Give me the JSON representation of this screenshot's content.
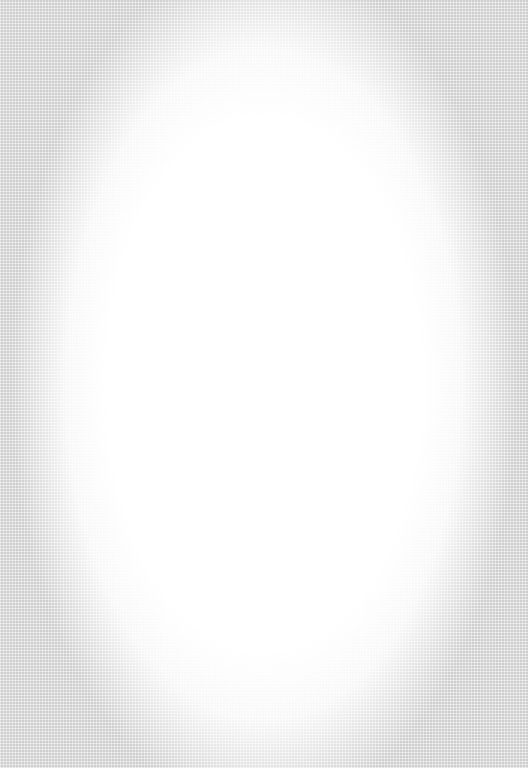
{
  "page": {
    "background": {
      "edge_color": "#e2e2e2",
      "center_color": "#ffffff",
      "texture": "linen"
    }
  }
}
